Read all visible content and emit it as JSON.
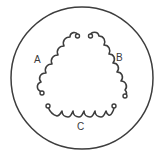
{
  "diagram": {
    "type": "three-coil winding diagram",
    "colors": {
      "line": "#3d3d3d",
      "background": "#ffffff",
      "text": "#3a3a3a"
    },
    "enclosure": {
      "shape": "circle"
    },
    "coils": [
      {
        "id": "A",
        "label": "A",
        "position": "left side"
      },
      {
        "id": "B",
        "label": "B",
        "position": "right side"
      },
      {
        "id": "C",
        "label": "C",
        "position": "bottom"
      }
    ]
  }
}
